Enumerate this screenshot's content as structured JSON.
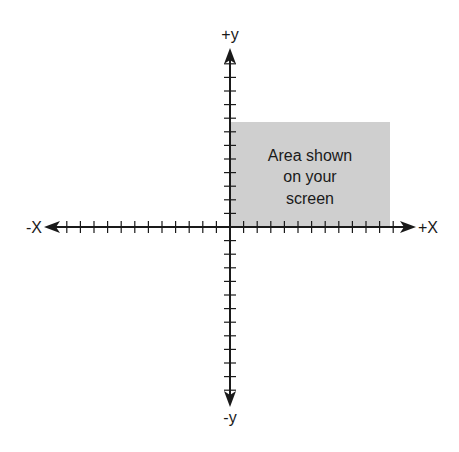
{
  "diagram": {
    "type": "coordinate-plane",
    "origin": {
      "x": 230,
      "y": 227
    },
    "tick_spacing": 13.6,
    "ticks_per_half_axis": 12,
    "colors": {
      "axis": "#1a1a1a",
      "area_fill": "#cfcfcf",
      "background": "#ffffff"
    },
    "labels": {
      "pos_y": "+y",
      "neg_y": "-y",
      "pos_x": "+X",
      "neg_x": "-X"
    },
    "highlight_area": {
      "x": 230,
      "y": 122,
      "width": 160,
      "height": 105,
      "text_lines": [
        "Area shown",
        "on your",
        "screen"
      ]
    }
  }
}
